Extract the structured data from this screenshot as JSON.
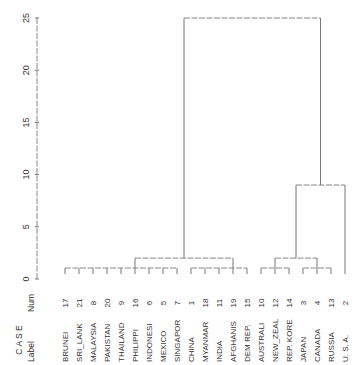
{
  "chart_data": {
    "type": "dendrogram",
    "title": "",
    "ylabel": "",
    "ylim": [
      0,
      25
    ],
    "yticks": [
      0,
      5,
      10,
      15,
      20,
      25
    ],
    "header": {
      "case": "C A S E",
      "label": "Label",
      "num": "Num"
    },
    "leaves": [
      {
        "label": "BRUNEI",
        "num": "17"
      },
      {
        "label": "SRI_LANK",
        "num": "21"
      },
      {
        "label": "MALAYSIA",
        "num": "8"
      },
      {
        "label": "PAKISTAN",
        "num": "20"
      },
      {
        "label": "THAILAND",
        "num": "9"
      },
      {
        "label": "PHILIPPI",
        "num": "16"
      },
      {
        "label": "INDONESI",
        "num": "6"
      },
      {
        "label": "MEXICO",
        "num": "5"
      },
      {
        "label": "SINGAPOR",
        "num": "7"
      },
      {
        "label": "CHINA",
        "num": "1"
      },
      {
        "label": "MYANMAR",
        "num": "18"
      },
      {
        "label": "INDIA",
        "num": "11"
      },
      {
        "label": "AFGHANIS",
        "num": "19"
      },
      {
        "label": "DEM REP.",
        "num": "15"
      },
      {
        "label": "AUSTRALI",
        "num": "10"
      },
      {
        "label": "NEW_ZEAL",
        "num": "12"
      },
      {
        "label": "REP. KORE",
        "num": "14"
      },
      {
        "label": "JAPAN",
        "num": "3"
      },
      {
        "label": "CANADA",
        "num": "4"
      },
      {
        "label": "RUSSIA",
        "num": "13"
      },
      {
        "label": "U. S. A.",
        "num": "2"
      }
    ],
    "merges": [
      {
        "members": [
          "BRUNEI",
          "SRI_LANK",
          "MALAYSIA",
          "PAKISTAN",
          "THAILAND",
          "PHILIPPI",
          "INDONESI",
          "MEXICO",
          "SINGAPOR"
        ],
        "height": 1
      },
      {
        "members": [
          "CHINA",
          "MYANMAR",
          "INDIA",
          "AFGHANIS",
          "DEM REP."
        ],
        "height": 1
      },
      {
        "members": [
          "cluster-asia-1",
          "cluster-asia-2"
        ],
        "height": 2
      },
      {
        "members": [
          "AUSTRALI",
          "NEW_ZEAL",
          "REP. KORE"
        ],
        "height": 1
      },
      {
        "members": [
          "JAPAN",
          "CANADA",
          "RUSSIA"
        ],
        "height": 1
      },
      {
        "members": [
          "cluster-pacific-1",
          "cluster-pacific-2"
        ],
        "height": 2
      },
      {
        "members": [
          "cluster-pacific",
          "U. S. A."
        ],
        "height": 9
      },
      {
        "members": [
          "cluster-asia",
          "cluster-west"
        ],
        "height": 25
      }
    ]
  }
}
